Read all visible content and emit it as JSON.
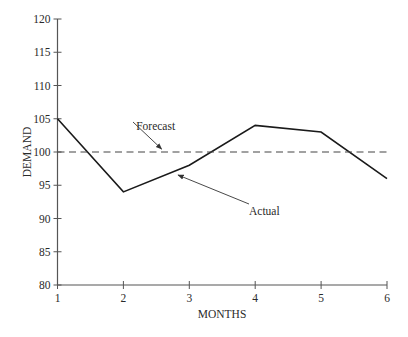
{
  "chart_data": {
    "type": "line",
    "title": "",
    "xlabel": "MONTHS",
    "ylabel": "DEMAND",
    "x": [
      1,
      2,
      3,
      4,
      5,
      6
    ],
    "xlim": [
      1,
      6
    ],
    "ylim": [
      80,
      120
    ],
    "xticks": [
      1,
      2,
      3,
      4,
      5,
      6
    ],
    "yticks": [
      80,
      85,
      90,
      95,
      100,
      105,
      110,
      115,
      120
    ],
    "grid": false,
    "legend": "none",
    "series": [
      {
        "name": "Actual",
        "style": "solid",
        "color": "#1a1a1a",
        "values": [
          105,
          94,
          98,
          104,
          103,
          96
        ]
      },
      {
        "name": "Forecast",
        "style": "dashed",
        "color": "#444444",
        "values": [
          100,
          100,
          100,
          100,
          100,
          100
        ]
      }
    ],
    "annotations": [
      {
        "text": "Forecast",
        "points_to": "Forecast",
        "text_pos": [
          2.55,
          103.0
        ],
        "arrow_to": [
          2.55,
          100.3
        ]
      },
      {
        "text": "Actual",
        "points_to": "Actual",
        "text_pos": [
          4.1,
          91.0
        ],
        "arrow_to": [
          2.92,
          96.8
        ]
      }
    ]
  }
}
